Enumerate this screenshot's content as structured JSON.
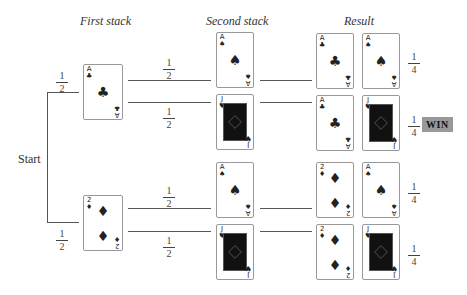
{
  "headers": {
    "first_stack": "First stack",
    "second_stack": "Second stack",
    "result": "Result"
  },
  "start_label": "Start",
  "win_label": "WIN",
  "probabilities": {
    "first_top": {
      "num": "1",
      "den": "2"
    },
    "first_bottom": {
      "num": "1",
      "den": "2"
    },
    "b1_top": {
      "num": "1",
      "den": "2"
    },
    "b1_bottom": {
      "num": "1",
      "den": "2"
    },
    "b2_top": {
      "num": "1",
      "den": "2"
    },
    "b2_bottom": {
      "num": "1",
      "den": "2"
    },
    "r1": {
      "num": "1",
      "den": "4"
    },
    "r2": {
      "num": "1",
      "den": "4"
    },
    "r3": {
      "num": "1",
      "den": "4"
    },
    "r4": {
      "num": "1",
      "den": "4"
    }
  },
  "cards": {
    "first": [
      {
        "rank": "A",
        "suit": "♣",
        "type": "ace"
      },
      {
        "rank": "2",
        "suit": "♦",
        "type": "two"
      }
    ],
    "second": [
      {
        "rank": "A",
        "suit": "♠",
        "type": "ace"
      },
      {
        "rank": "J",
        "suit": "♥",
        "type": "face"
      },
      {
        "rank": "A",
        "suit": "♠",
        "type": "ace"
      },
      {
        "rank": "J",
        "suit": "♥",
        "type": "face"
      }
    ],
    "result": [
      [
        {
          "rank": "A",
          "suit": "♣"
        },
        {
          "rank": "A",
          "suit": "♠"
        }
      ],
      [
        {
          "rank": "A",
          "suit": "♣"
        },
        {
          "rank": "J",
          "suit": "♥"
        }
      ],
      [
        {
          "rank": "2",
          "suit": "♦"
        },
        {
          "rank": "A",
          "suit": "♠"
        }
      ],
      [
        {
          "rank": "2",
          "suit": "♦"
        },
        {
          "rank": "J",
          "suit": "♥"
        }
      ]
    ]
  },
  "winning_row": 2
}
